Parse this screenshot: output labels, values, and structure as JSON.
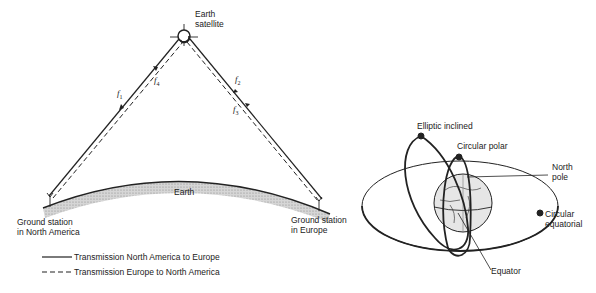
{
  "left_diagram": {
    "satellite_label_line1": "Earth",
    "satellite_label_line2": "satellite",
    "earth_label": "Earth",
    "station_na_line1": "Ground station",
    "station_na_line2": "in North America",
    "station_eu_line1": "Ground station",
    "station_eu_line2": "in Europe",
    "freq_labels": {
      "f1": "f",
      "f1_sub": "1",
      "f2": "f",
      "f2_sub": "2",
      "f3": "f",
      "f3_sub": "3",
      "f4": "f",
      "f4_sub": "4"
    },
    "legend": [
      {
        "style": "solid",
        "label": "Transmission North America to Europe"
      },
      {
        "style": "dashed",
        "label": "Transmission Europe to North America"
      }
    ]
  },
  "right_diagram": {
    "labels": {
      "elliptic_inclined": "Elliptic inclined",
      "circular_polar": "Circular polar",
      "north_pole_line1": "North",
      "north_pole_line2": "pole",
      "circular_equatorial_line1": "Circular",
      "circular_equatorial_line2": "equatorial",
      "equator": "Equator"
    }
  },
  "colors": {
    "ink": "#222222",
    "earth_fill": "#bdbdbd",
    "background": "#ffffff"
  }
}
